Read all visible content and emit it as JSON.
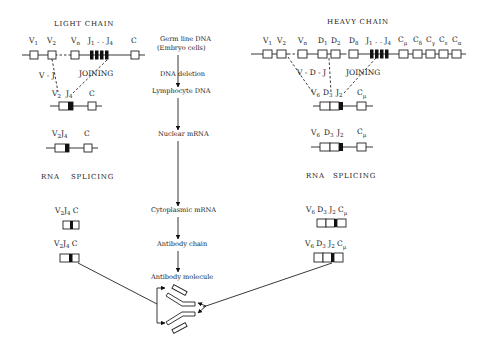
{
  "light_chain": {
    "title": "LIGHT CHAIN",
    "germline_labels": [
      "V1",
      "V2",
      "Vn",
      "J1 .. J4",
      "C"
    ],
    "vj_label": "V - J",
    "joining_label": "JOINING",
    "rearranged_labels": [
      "V2",
      "J4",
      "C"
    ],
    "nuclear_labels": [
      "V2",
      "J4",
      "C"
    ],
    "rna_label": "RNA",
    "splicing_label": "SPLICING",
    "cyto_label": "V2J4 C",
    "chain_label": "V2J4 C"
  },
  "heavy_chain": {
    "title": "HEAVY CHAIN",
    "germline_labels": [
      "V1",
      "V2",
      "Vn",
      "D1",
      "D2",
      "D8",
      "J1 .. J4",
      "Cμ",
      "Cδ",
      "Cγ",
      "Cε",
      "Cα"
    ],
    "vdj_label": "V - D - J",
    "joining_label": "JOINING",
    "rearranged_labels": [
      "V6",
      "D3",
      "J2",
      "Cμ"
    ],
    "nuclear_labels": [
      "V6",
      "D3",
      "J2",
      "Cμ"
    ],
    "rna_label": "RNA",
    "splicing_label": "SPLICING",
    "cyto_label": "V6 D3 J2 Cμ",
    "chain_label": "V6 D3 J2 Cμ"
  },
  "flow": {
    "germline_line1": "Germ line DNA",
    "germline_line2": "(Embryo cells)",
    "dna_deletion": "DNA deletion",
    "lymphocyte_dna": "Lymphocyte DNA",
    "nuclear_mrna": "Nuclear mRNA",
    "cytoplasmic_mrna": "Cytoplasmic mRNA",
    "antibody_chain": "Antibody chain",
    "antibody_molecule": "Antibody molecule"
  },
  "colors": {
    "ink": "#1a1a1a",
    "background": "#ffffff"
  }
}
